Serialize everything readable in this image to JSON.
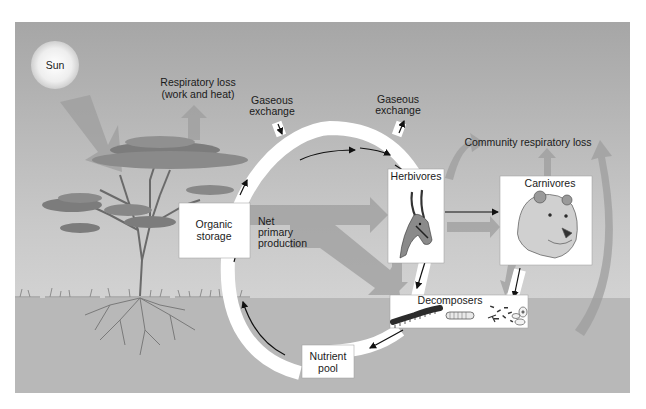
{
  "diagram": {
    "colors": {
      "sky_top": "#a9a9a9",
      "sky_bottom": "#d9d9d9",
      "ground": "#b9b9b9",
      "flow_arrow": "#9a9a9a",
      "box_fill": "#ffffff",
      "cycle_fill": "#ffffff",
      "text": "#1a1a1a"
    },
    "labels": {
      "sun": "Sun",
      "respiratory_loss_line1": "Respiratory loss",
      "respiratory_loss_line2": "(work and heat)",
      "gaseous_exchange_left_line1": "Gaseous",
      "gaseous_exchange_left_line2": "exchange",
      "gaseous_exchange_right_line1": "Gaseous",
      "gaseous_exchange_right_line2": "exchange",
      "community_respiratory_loss": "Community respiratory loss",
      "net_primary_production_line1": "Net",
      "net_primary_production_line2": "primary",
      "net_primary_production_line3": "production"
    },
    "nodes": {
      "organic_storage_line1": "Organic",
      "organic_storage_line2": "storage",
      "herbivores": "Herbivores",
      "carnivores": "Carnivores",
      "decomposers": "Decomposers",
      "nutrient_pool_line1": "Nutrient",
      "nutrient_pool_line2": "pool"
    },
    "icons": [
      "sun-icon",
      "acacia-tree-icon",
      "gazelle-icon",
      "lion-icon",
      "millipede-icon",
      "grub-icon",
      "bacteria-icon",
      "protozoa-icon"
    ]
  }
}
